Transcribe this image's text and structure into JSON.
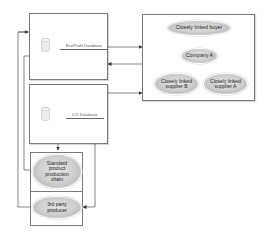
{
  "diagram": {
    "databases": [
      {
        "id": "db1",
        "label": "EcoProfil Database",
        "icon": "database-cylinder-icon"
      },
      {
        "id": "db2",
        "label": "LCI Database",
        "icon": "database-cylinder-icon"
      }
    ],
    "supply_chain": {
      "nodes": [
        {
          "id": "buyer",
          "label": "Closely linked buyer"
        },
        {
          "id": "company",
          "label": "Company A"
        },
        {
          "id": "supplierB",
          "label_line1": "Closely linked",
          "label_line2": "supplier B"
        },
        {
          "id": "supplierA",
          "label_line1": "Closely linked",
          "label_line2": "supplier A"
        }
      ]
    },
    "producers": [
      {
        "id": "standard",
        "lines": [
          "Standard",
          "product",
          "production",
          "chain"
        ]
      },
      {
        "id": "thirdparty",
        "lines": [
          "3rd party",
          "producer"
        ]
      }
    ],
    "colors": {
      "line": "#555555",
      "box_border": "#7a7a7a",
      "ellipse_fill": "#cfcfcf",
      "ellipse_edge": "#a9a9a9"
    }
  }
}
